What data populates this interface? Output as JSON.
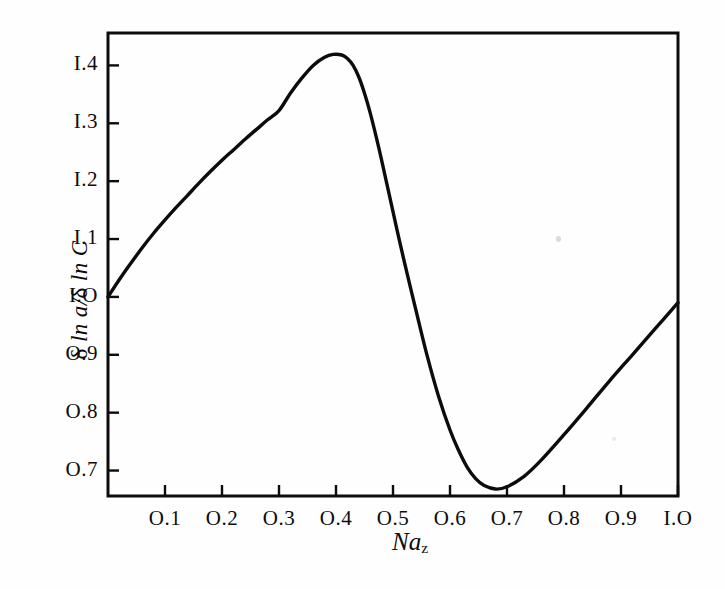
{
  "figure": {
    "background_color": "#fefefe",
    "ink_color": "#0c0c0c"
  },
  "axes": {
    "y_label_parts": {
      "delta1": "δ",
      "ln1": " ln ",
      "a": "a",
      "slash": "/",
      "delta2": "δ",
      "ln2": " ln ",
      "C": "C"
    },
    "y_label_text": "δ ln a/δ ln C",
    "x_label_base": "Na",
    "x_label_sub": "z",
    "x_label_text": "Naz"
  },
  "chart_data": {
    "type": "line",
    "title": "",
    "subtitle": "",
    "xlabel": "Na_z",
    "ylabel": "δ ln a/δ ln C",
    "xlim": [
      0.0,
      1.0
    ],
    "ylim": [
      0.656,
      1.456
    ],
    "grid": false,
    "legend": null,
    "xticks": [
      0.1,
      0.2,
      0.3,
      0.4,
      0.5,
      0.6,
      0.7,
      0.8,
      0.9,
      1.0
    ],
    "xtick_labels": [
      "O.1",
      "O.2",
      "O.3",
      "O.4",
      "O.5",
      "O.6",
      "O.7",
      "O.8",
      "O.9",
      "I.O"
    ],
    "yticks": [
      0.7,
      0.8,
      0.9,
      1.0,
      1.1,
      1.2,
      1.3,
      1.4
    ],
    "ytick_labels": [
      "O.7",
      "O.8",
      "O.9",
      "I.O",
      "I.1",
      "I.2",
      "I.3",
      "I.4"
    ],
    "series": [
      {
        "name": "delta ln a / delta ln C",
        "color": "#0c0c0c",
        "linewidth": 3.4,
        "x": [
          0.0,
          0.02,
          0.04,
          0.06,
          0.08,
          0.1,
          0.12,
          0.14,
          0.16,
          0.18,
          0.2,
          0.22,
          0.24,
          0.26,
          0.28,
          0.3,
          0.32,
          0.34,
          0.36,
          0.38,
          0.395,
          0.41,
          0.42,
          0.43,
          0.44,
          0.45,
          0.46,
          0.475,
          0.49,
          0.505,
          0.52,
          0.54,
          0.56,
          0.58,
          0.6,
          0.615,
          0.63,
          0.645,
          0.66,
          0.68,
          0.7,
          0.73,
          0.76,
          0.8,
          0.84,
          0.88,
          0.92,
          0.96,
          1.0
        ],
        "y": [
          1.0,
          1.03,
          1.058,
          1.085,
          1.11,
          1.133,
          1.155,
          1.176,
          1.197,
          1.217,
          1.236,
          1.254,
          1.272,
          1.289,
          1.306,
          1.322,
          1.352,
          1.378,
          1.4,
          1.414,
          1.419,
          1.418,
          1.412,
          1.4,
          1.38,
          1.352,
          1.318,
          1.258,
          1.192,
          1.125,
          1.06,
          0.978,
          0.898,
          0.828,
          0.77,
          0.735,
          0.706,
          0.686,
          0.674,
          0.668,
          0.672,
          0.69,
          0.718,
          0.762,
          0.808,
          0.855,
          0.9,
          0.945,
          0.99
        ]
      }
    ],
    "annotations": {
      "peak": {
        "x": 0.4,
        "y": 1.42
      },
      "minimum": {
        "x": 0.645,
        "y": 0.668
      },
      "start": {
        "x": 0.0,
        "y": 1.0
      },
      "end": {
        "x": 1.0,
        "y": 0.99
      }
    }
  }
}
